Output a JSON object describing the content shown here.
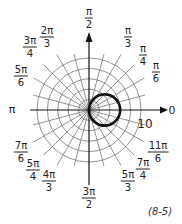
{
  "chart_data": {
    "type": "line",
    "subtype": "polar",
    "title": "",
    "equation_tag": "(8-5)",
    "curve": {
      "equation": "r = 6 cos θ",
      "shape": "circle",
      "diameter": 6,
      "center": [
        3,
        0
      ]
    },
    "radial_grid": {
      "rings": [
        2,
        4,
        6,
        8,
        10
      ],
      "max": 10,
      "label": "10"
    },
    "angular_grid_step_deg": 15,
    "angle_labels": [
      {
        "num": "π",
        "den": "2",
        "deg": 90
      },
      {
        "num": "π",
        "den": "3",
        "deg": 60
      },
      {
        "num": "π",
        "den": "4",
        "deg": 45
      },
      {
        "num": "π",
        "den": "6",
        "deg": 30
      },
      {
        "text": "0",
        "deg": 0
      },
      {
        "num": "11π",
        "den": "6",
        "deg": 330
      },
      {
        "num": "7π",
        "den": "4",
        "deg": 315
      },
      {
        "num": "5π",
        "den": "3",
        "deg": 300
      },
      {
        "num": "3π",
        "den": "2",
        "deg": 270
      },
      {
        "num": "4π",
        "den": "3",
        "deg": 240
      },
      {
        "num": "5π",
        "den": "4",
        "deg": 225
      },
      {
        "num": "7π",
        "den": "6",
        "deg": 210
      },
      {
        "text": "π",
        "deg": 180
      },
      {
        "num": "5π",
        "den": "6",
        "deg": 150
      },
      {
        "num": "3π",
        "den": "4",
        "deg": 135
      },
      {
        "num": "2π",
        "den": "3",
        "deg": 120
      }
    ]
  },
  "labels": {
    "pi_half": {
      "num": "π",
      "den": "2"
    },
    "pi_third": {
      "num": "π",
      "den": "3"
    },
    "pi_quarter": {
      "num": "π",
      "den": "4"
    },
    "pi_sixth": {
      "num": "π",
      "den": "6"
    },
    "zero": "0",
    "eleven_pi_sixth": {
      "num": "11π",
      "den": "6"
    },
    "seven_pi_quarter": {
      "num": "7π",
      "den": "4"
    },
    "five_pi_third": {
      "num": "5π",
      "den": "3"
    },
    "three_pi_half": {
      "num": "3π",
      "den": "2"
    },
    "four_pi_third": {
      "num": "4π",
      "den": "3"
    },
    "five_pi_quarter": {
      "num": "5π",
      "den": "4"
    },
    "seven_pi_sixth": {
      "num": "7π",
      "den": "6"
    },
    "pi": "π",
    "five_pi_sixth": {
      "num": "5π",
      "den": "6"
    },
    "three_pi_quarter": {
      "num": "3π",
      "den": "4"
    },
    "two_pi_third": {
      "num": "2π",
      "den": "3"
    },
    "ring_label": "10",
    "tag": "(8-5)"
  }
}
